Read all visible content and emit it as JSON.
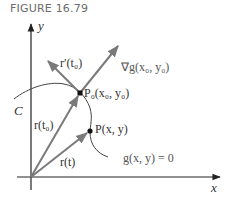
{
  "figure": {
    "title": "FIGURE 16.79"
  },
  "axes": {
    "x_label": "x",
    "y_label": "y"
  },
  "labels": {
    "curve": "C",
    "tangent_vector": "r′(t₀)",
    "gradient_vector": "∇g(x₀, y₀)",
    "point_p0": "P₀(x₀, y₀)",
    "point_p": "P(x, y)",
    "position_t0": "r(t₀)",
    "position_t": "r(t)",
    "equation": "g(x, y) = 0"
  },
  "colors": {
    "axis": "#222222",
    "vector": "#7a7a7a",
    "curve": "#444444",
    "text": "#555555"
  }
}
